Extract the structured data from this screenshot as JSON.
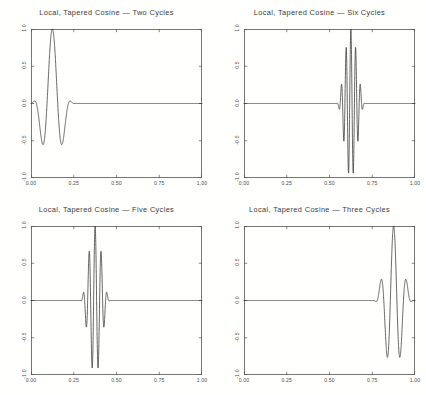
{
  "figure": {
    "background_color": "#ffffff",
    "line_color": "#333333",
    "axis_color": "#555555",
    "text_color": "#3a3a3a",
    "width": 426,
    "height": 395,
    "rows": 2,
    "cols": 2
  },
  "chart_data": [
    {
      "type": "line",
      "title": "Local, Tapered Cosine — Two Cycles",
      "xlabel": "",
      "ylabel": "",
      "xlim": [
        0.0,
        1.0
      ],
      "ylim": [
        -1.0,
        1.0
      ],
      "xticks": [
        0.0,
        0.25,
        0.5,
        0.75,
        1.0
      ],
      "xticklabels": [
        "0.00",
        "0.25",
        "0.50",
        "0.75",
        "1.00"
      ],
      "yticks": [
        -1.0,
        -0.5,
        0.0,
        0.5,
        1.0
      ],
      "yticklabels": [
        "-1.0",
        "-0.5",
        "0.0",
        "0.5",
        "1.0"
      ],
      "grid": false,
      "legend": null,
      "series": [
        {
          "name": "tapered cosine",
          "cycles": 2,
          "center": 0.125,
          "half_width": 0.125,
          "amplitude": 1.0,
          "description": "Gaussian/Hann tapered cosine packet of two cycles, localized near x = 0.125, zero elsewhere"
        }
      ]
    },
    {
      "type": "line",
      "title": "Local, Tapered Cosine — Six Cycles",
      "xlabel": "",
      "ylabel": "",
      "xlim": [
        0.0,
        1.0
      ],
      "ylim": [
        -1.0,
        1.0
      ],
      "xticks": [
        0.0,
        0.25,
        0.5,
        0.75,
        1.0
      ],
      "xticklabels": [
        "0.00",
        "0.25",
        "0.50",
        "0.75",
        "1.00"
      ],
      "yticks": [
        -1.0,
        -0.5,
        0.0,
        0.5,
        1.0
      ],
      "yticklabels": [
        "-1.0",
        "-0.5",
        "0.0",
        "0.5",
        "1.0"
      ],
      "grid": false,
      "legend": null,
      "series": [
        {
          "name": "tapered cosine",
          "cycles": 6,
          "center": 0.625,
          "half_width": 0.0833,
          "amplitude": 1.0,
          "description": "Gaussian/Hann tapered cosine packet of six cycles, localized near x = 0.625, zero elsewhere"
        }
      ]
    },
    {
      "type": "line",
      "title": "Local, Tapered Cosine — Five Cycles",
      "xlabel": "",
      "ylabel": "",
      "xlim": [
        0.0,
        1.0
      ],
      "ylim": [
        -1.0,
        1.0
      ],
      "xticks": [
        0.0,
        0.25,
        0.5,
        0.75,
        1.0
      ],
      "xticklabels": [
        "0.00",
        "0.25",
        "0.50",
        "0.75",
        "1.00"
      ],
      "yticks": [
        -1.0,
        -0.5,
        0.0,
        0.5,
        1.0
      ],
      "yticklabels": [
        "-1.0",
        "-0.5",
        "0.0",
        "0.5",
        "1.0"
      ],
      "grid": false,
      "legend": null,
      "series": [
        {
          "name": "tapered cosine",
          "cycles": 5,
          "center": 0.375,
          "half_width": 0.0875,
          "amplitude": 1.0,
          "description": "Gaussian/Hann tapered cosine packet of five cycles, localized near x = 0.375, zero elsewhere"
        }
      ]
    },
    {
      "type": "line",
      "title": "Local, Tapered Cosine — Three Cycles",
      "xlabel": "",
      "ylabel": "",
      "xlim": [
        0.0,
        1.0
      ],
      "ylim": [
        -1.0,
        1.0
      ],
      "xticks": [
        0.0,
        0.25,
        0.5,
        0.75,
        1.0
      ],
      "xticklabels": [
        "0.00",
        "0.25",
        "0.50",
        "0.75",
        "1.00"
      ],
      "yticks": [
        -1.0,
        -0.5,
        0.0,
        0.5,
        1.0
      ],
      "yticklabels": [
        "-1.0",
        "-0.5",
        "0.0",
        "0.5",
        "1.0"
      ],
      "grid": false,
      "legend": null,
      "series": [
        {
          "name": "tapered cosine",
          "cycles": 3,
          "center": 0.875,
          "half_width": 0.115,
          "amplitude": 1.0,
          "description": "Gaussian/Hann tapered cosine packet of three cycles, localized near x = 0.875, zero elsewhere"
        }
      ]
    }
  ]
}
